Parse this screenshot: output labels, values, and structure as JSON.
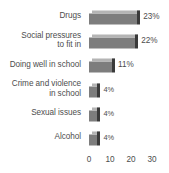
{
  "chart_data": {
    "type": "bar",
    "orientation": "horizontal",
    "title": "",
    "subtitle": "",
    "xlabel": "",
    "ylabel": "",
    "grid": false,
    "legend": null,
    "xlim": [
      0,
      30
    ],
    "xticks": [
      "0",
      "10",
      "20",
      "30"
    ],
    "xtick_values": [
      0,
      10,
      20,
      30
    ],
    "categories": [
      "Drugs",
      "Social pressures\nto fit in",
      "Doing well in school",
      "Crime and violence\nin school",
      "Sexual issues",
      "Alcohol"
    ],
    "values": [
      23,
      22,
      11,
      4,
      4,
      4
    ],
    "data_labels": [
      "23%",
      "22%",
      "11%",
      "4%",
      "4%",
      "4%"
    ],
    "bar_color": "#7d7d7d",
    "bar_top_color": "#b4b4b4",
    "bar_side_color": "#3a3a3a",
    "text_color": "#4d4d4d",
    "background_color": "#ffffff"
  }
}
